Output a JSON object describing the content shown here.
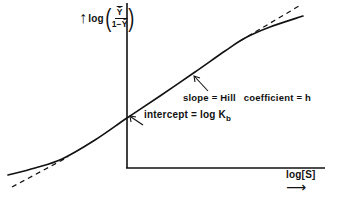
{
  "diagram": {
    "type": "hill-plot",
    "y_axis": {
      "label_prefix": "log",
      "fraction_numerator": "Ȳ",
      "fraction_denominator_prefix": "1−",
      "fraction_denominator_var": "Ȳ",
      "arrow": "↑",
      "open_paren": "(",
      "close_paren": ")"
    },
    "x_axis": {
      "label": "log[S]",
      "arrow": "⟶"
    },
    "annotations": {
      "slope_left": "slope = Hill",
      "slope_right": "coefficient = h",
      "intercept_main": "intercept = log K",
      "intercept_sub": "b"
    },
    "curve": {
      "style": "solid",
      "points": [
        [
          8,
          175
        ],
        [
          35,
          168
        ],
        [
          62,
          159
        ],
        [
          95,
          140
        ],
        [
          127,
          118
        ],
        [
          160,
          96
        ],
        [
          195,
          72
        ],
        [
          225,
          51
        ],
        [
          245,
          38
        ],
        [
          270,
          27
        ],
        [
          303,
          16
        ]
      ]
    },
    "asymptotes": [
      {
        "style": "dashed",
        "from": [
          12,
          187
        ],
        "to": [
          68,
          157
        ]
      },
      {
        "style": "dashed",
        "from": [
          240,
          41
        ],
        "to": [
          299,
          6
        ]
      }
    ],
    "colors": {
      "ink": "#111111",
      "background": "#ffffff"
    }
  }
}
